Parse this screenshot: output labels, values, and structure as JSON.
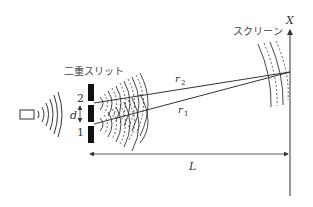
{
  "diagram": {
    "labels": {
      "double_slit": "二重スリット",
      "screen": "スクリーン",
      "axis": "X",
      "slit_upper": "2",
      "slit_lower": "1",
      "slit_spacing": "d",
      "path_upper": "r",
      "path_upper_sub": "2",
      "path_lower": "r",
      "path_lower_sub": "1",
      "distance": "L"
    },
    "colors": {
      "line": "#333333",
      "barrier": "#111111",
      "background": "#ffffff"
    }
  }
}
